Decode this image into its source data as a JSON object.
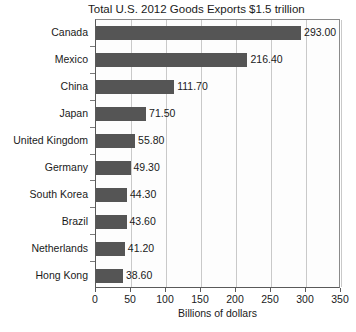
{
  "chart_data": {
    "type": "bar",
    "orientation": "horizontal",
    "title": "Total U.S. 2012 Goods Exports $1.5 trillion",
    "xlabel": "Billions of dollars",
    "ylabel": "",
    "xlim": [
      0,
      350
    ],
    "xticks": [
      0,
      50,
      100,
      150,
      200,
      250,
      300,
      350
    ],
    "xtick_labels": [
      "0",
      "50",
      "100",
      "150",
      "200",
      "250",
      "300",
      "350"
    ],
    "grid": true,
    "grid_axis": "x",
    "legend": false,
    "categories": [
      "Canada",
      "Mexico",
      "China",
      "Japan",
      "United Kingdom",
      "Germany",
      "South Korea",
      "Brazil",
      "Netherlands",
      "Hong Kong"
    ],
    "values": [
      293.0,
      216.4,
      111.7,
      71.5,
      55.8,
      49.3,
      44.3,
      43.6,
      41.2,
      38.6
    ],
    "data_labels": [
      "293.00",
      "216.40",
      "111.70",
      "71.50",
      "55.80",
      "49.30",
      "44.30",
      "43.60",
      "41.20",
      "38.60"
    ],
    "bar_color": "#555555",
    "grid_color": "#c9c9c9",
    "axis_color": "#5a5a5a",
    "text_color": "#1a1a1a",
    "background_color": "#ffffff"
  }
}
